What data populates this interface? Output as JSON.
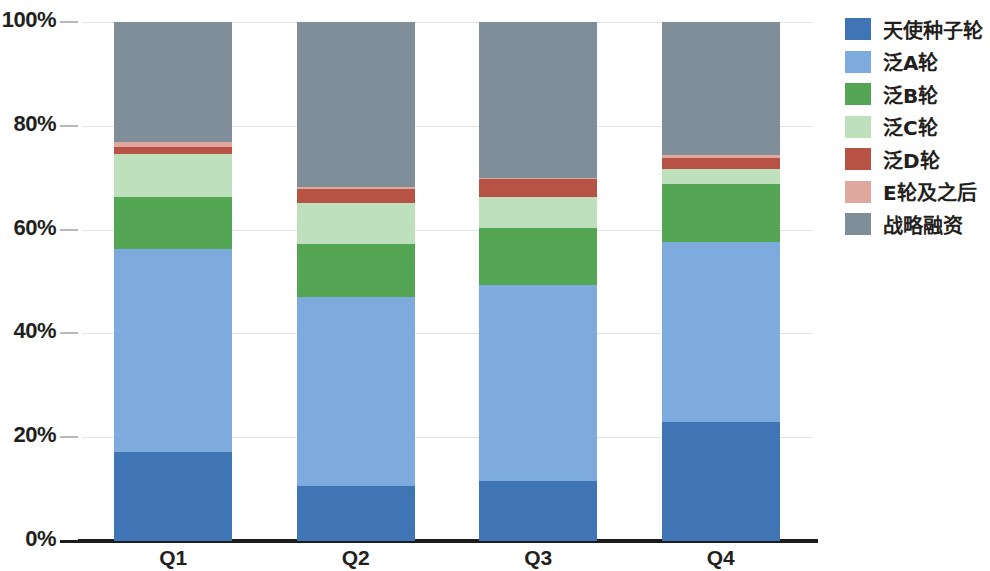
{
  "chart_data": {
    "type": "bar",
    "stacked": true,
    "normalized": true,
    "title": "",
    "subtitle": "",
    "xlabel": "",
    "ylabel": "",
    "categories": [
      "Q1",
      "Q2",
      "Q3",
      "Q4"
    ],
    "ylim": [
      0,
      100
    ],
    "yticks": [
      0,
      20,
      40,
      60,
      80,
      100
    ],
    "ytick_labels": [
      "0%",
      "20%",
      "40%",
      "60%",
      "80%",
      "100%"
    ],
    "grid": true,
    "grid_axis": "y",
    "legend_position": "right",
    "series": [
      {
        "name": "天使种子轮",
        "color": "#3f74b5",
        "values": [
          17.1,
          10.6,
          11.6,
          22.9
        ]
      },
      {
        "name": "泛A轮",
        "color": "#7dabdd",
        "values": [
          39.2,
          36.4,
          37.7,
          34.8
        ]
      },
      {
        "name": "泛B轮",
        "color": "#54a654",
        "values": [
          10.0,
          10.2,
          11.0,
          11.1
        ]
      },
      {
        "name": "泛C轮",
        "color": "#bfe0bc",
        "values": [
          8.3,
          8.0,
          5.9,
          2.9
        ]
      },
      {
        "name": "泛D轮",
        "color": "#b75344",
        "values": [
          1.4,
          2.7,
          3.5,
          2.0
        ]
      },
      {
        "name": "E轮及之后",
        "color": "#e0a79f",
        "values": [
          0.8,
          0.3,
          0.2,
          0.6
        ]
      },
      {
        "name": "战略融资",
        "color": "#7f8e99",
        "values": [
          23.2,
          31.8,
          30.1,
          25.7
        ]
      }
    ]
  },
  "axis": {
    "tick_color": "#b9b9b9",
    "axis_color": "#1c1c1c",
    "grid_color": "#e3e3e3"
  }
}
